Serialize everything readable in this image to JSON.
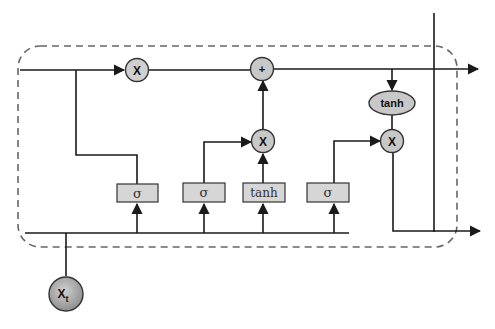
{
  "diagram": {
    "type": "LSTM cell",
    "colors": {
      "line": "#1a1a1a",
      "node_fill": "#c8c8c8",
      "node_stroke": "#333333",
      "gate_fill": "#d6d6d6",
      "dashed_border": "#666666",
      "input_fill_light": "#d0d0d0",
      "input_fill_dark": "#8a8a8a"
    },
    "operators": {
      "forget_multiply": "X",
      "cell_add": "+",
      "input_multiply": "X",
      "output_tanh": "tanh",
      "output_multiply": "X"
    },
    "gates": [
      {
        "id": "forget_gate",
        "label": "σ"
      },
      {
        "id": "input_gate",
        "label": "σ"
      },
      {
        "id": "candidate",
        "label": "tanh"
      },
      {
        "id": "output_gate",
        "label": "σ"
      }
    ],
    "input": {
      "label": "X",
      "subscript": "t"
    }
  }
}
